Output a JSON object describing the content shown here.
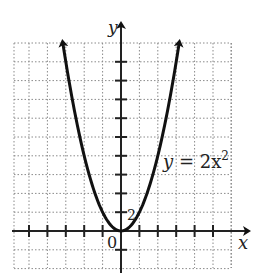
{
  "chart_data": {
    "type": "line",
    "title": "",
    "equation_label": "y = 2x²",
    "function": "y = 2x^2",
    "xlabel": "x",
    "ylabel": "y",
    "origin_label": "0",
    "y_tick_label": "2",
    "x_tick_step": 1,
    "y_tick_step": 2,
    "xlim": [
      -5.8,
      5.9
    ],
    "ylim": [
      -4,
      20
    ],
    "grid": true,
    "grid_style": "dotted",
    "x": [
      -3.16,
      -3,
      -2.5,
      -2,
      -1.5,
      -1,
      -0.5,
      0,
      0.5,
      1,
      1.5,
      2,
      2.5,
      3,
      3.16
    ],
    "values": [
      20,
      18,
      12.5,
      8,
      4.5,
      2,
      0.5,
      0,
      0.5,
      2,
      4.5,
      8,
      12.5,
      18,
      20
    ],
    "arrows_on_curve_ends": true,
    "colors": {
      "curve": "#111111",
      "axis": "#222222",
      "grid": "#8a8a8a",
      "background": "#ffffff"
    }
  },
  "labels": {
    "equation_y": "y",
    "equation_rest": " = 2x",
    "equation_exp": "2",
    "x_axis": "x",
    "y_axis": "y",
    "origin": "0",
    "y_tick": "2"
  }
}
